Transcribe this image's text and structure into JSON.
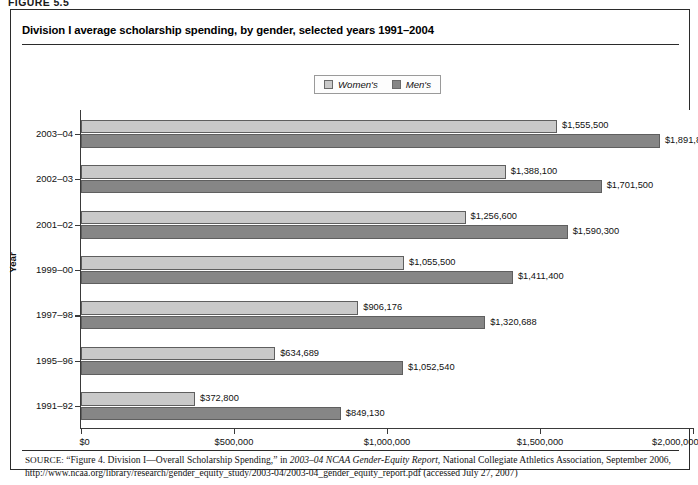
{
  "figure_label": "FIGURE 5.5",
  "chart_title": "Division I average scholarship spending, by gender, selected years 1991–2004",
  "legend": {
    "items": [
      {
        "label": "Women's",
        "color": "#c9c9c9"
      },
      {
        "label": "Men's",
        "color": "#868686"
      }
    ]
  },
  "axes": {
    "y_title": "Year",
    "x_ticks": [
      "$0",
      "$500,000",
      "$1,000,000",
      "$1,500,000",
      "$2,000,000"
    ]
  },
  "source": {
    "kicker": "SOURCE:",
    "part1": " “Figure 4. Division I—Overall Scholarship Spending,” in ",
    "italic1": "2003–04 NCAA Gender-Equity Report",
    "part2": ", National Collegiate Athletics Association, September 2006, http://www.ncaa.org/library/research/gender_equity_study/2003-04/2003-04_gender_equity_report.pdf (accessed July 27, 2007)"
  },
  "chart_data": {
    "type": "bar",
    "orientation": "horizontal",
    "title": "Division I average scholarship spending, by gender, selected years 1991–2004",
    "xlabel": "",
    "ylabel": "Year",
    "xlim": [
      0,
      2000000
    ],
    "xticks": [
      0,
      500000,
      1000000,
      1500000,
      2000000
    ],
    "grid": false,
    "legend_position": "top-center",
    "categories": [
      "2003–04",
      "2002–03",
      "2001–02",
      "1999–00",
      "1997–98",
      "1995–96",
      "1991–92"
    ],
    "series": [
      {
        "name": "Women's",
        "color": "#c9c9c9",
        "values": [
          1555500,
          1388100,
          1256600,
          1055500,
          906176,
          634689,
          372800
        ],
        "labels": [
          "$1,555,500",
          "$1,388,100",
          "$1,256,600",
          "$1,055,500",
          "$906,176",
          "$634,689",
          "$372,800"
        ]
      },
      {
        "name": "Men's",
        "color": "#868686",
        "values": [
          1891800,
          1701500,
          1590300,
          1411400,
          1320688,
          1052540,
          849130
        ],
        "labels": [
          "$1,891,800",
          "$1,701,500",
          "$1,590,300",
          "$1,411,400",
          "$1,320,688",
          "$1,052,540",
          "$849,130"
        ]
      }
    ]
  }
}
